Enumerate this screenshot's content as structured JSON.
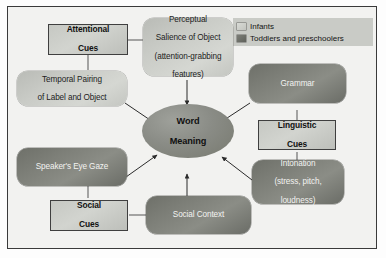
{
  "figure": {
    "legend": {
      "items": [
        {
          "label": "Infants",
          "swatch": "light-gray-capsule",
          "color": "#c9cbc6"
        },
        {
          "label": "Toddlers and preschoolers",
          "swatch": "dark-gray-capsule",
          "color": "#6e7069"
        }
      ]
    },
    "center": {
      "name": "word-meaning",
      "line1": "Word",
      "line2": "Meaning",
      "shape": "ellipse",
      "color": "#8a8c86"
    },
    "category_boxes": [
      {
        "id": "attentional",
        "line1": "Attentional",
        "line2": "Cues"
      },
      {
        "id": "linguistic",
        "line1": "Linguistic",
        "line2": "Cues"
      },
      {
        "id": "social",
        "line1": "Social",
        "line2": "Cues"
      }
    ],
    "nodes": [
      {
        "id": "temporal-pairing",
        "group": "infants",
        "lines": [
          "Temporal Pairing",
          "of Label and Object"
        ]
      },
      {
        "id": "perceptual-salience",
        "group": "infants",
        "lines": [
          "Perceptual",
          "Salience of Object",
          "(attention-grabbing",
          "features)"
        ]
      },
      {
        "id": "grammar",
        "group": "toddlers",
        "lines": [
          "Grammar"
        ]
      },
      {
        "id": "intonation",
        "group": "toddlers",
        "lines": [
          "Intonation",
          "(stress, pitch,",
          "loudness)"
        ]
      },
      {
        "id": "speakers-eye-gaze",
        "group": "toddlers",
        "lines": [
          "Speaker's Eye Gaze"
        ]
      },
      {
        "id": "social-context",
        "group": "toddlers",
        "lines": [
          "Social Context"
        ]
      }
    ],
    "colors": {
      "frame_border": "#3a3a3a",
      "canvas": "#f2f2f0",
      "infants": "#c9cbc6",
      "toddlers": "#6e7069",
      "center": "#8a8c86",
      "arrow": "#2b2b2b"
    }
  }
}
